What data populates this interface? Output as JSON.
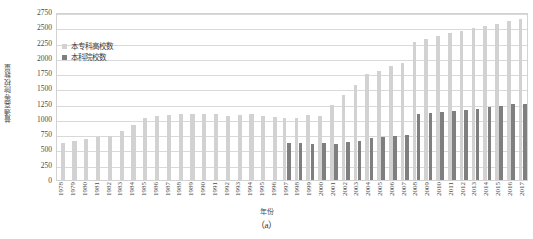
{
  "chart_data": {
    "type": "bar",
    "title": "",
    "caption": "（a）",
    "xlabel": "年份",
    "ylabel": "普通高等院校数量",
    "ylim": [
      0,
      2750
    ],
    "ytick_step": 250,
    "yticks": [
      2750,
      2500,
      2250,
      2000,
      1750,
      1500,
      1250,
      1000,
      750,
      500,
      250,
      0
    ],
    "grid": true,
    "legend_position": "top-left",
    "categories": [
      "1978",
      "1979",
      "1980",
      "1981",
      "1982",
      "1983",
      "1984",
      "1985",
      "1986",
      "1987",
      "1988",
      "1989",
      "1990",
      "1991",
      "1992",
      "1993",
      "1994",
      "1995",
      "1996",
      "1997",
      "1998",
      "1999",
      "2000",
      "2001",
      "2002",
      "2003",
      "2004",
      "2005",
      "2006",
      "2007",
      "2008",
      "2009",
      "2010",
      "2011",
      "2012",
      "2013",
      "2014",
      "2015",
      "2016",
      "2017"
    ],
    "series": [
      {
        "name": "本专科高校数",
        "color": "#d2d2d2",
        "values": [
          598,
          633,
          675,
          704,
          715,
          805,
          902,
          1016,
          1054,
          1063,
          1075,
          1075,
          1075,
          1075,
          1053,
          1065,
          1080,
          1054,
          1032,
          1020,
          1022,
          1071,
          1041,
          1225,
          1396,
          1552,
          1731,
          1792,
          1867,
          1908,
          2263,
          2305,
          2358,
          2409,
          2442,
          2491,
          2529,
          2560,
          2596,
          2631
        ]
      },
      {
        "name": "本科院校数",
        "color": "#7f7f7f",
        "values": [
          null,
          null,
          null,
          null,
          null,
          null,
          null,
          null,
          null,
          null,
          null,
          null,
          null,
          null,
          null,
          null,
          null,
          null,
          null,
          610,
          600,
          597,
          599,
          597,
          629,
          644,
          684,
          701,
          720,
          740,
          1079,
          1090,
          1112,
          1129,
          1145,
          1170,
          1202,
          1219,
          1237,
          1243
        ]
      }
    ]
  }
}
